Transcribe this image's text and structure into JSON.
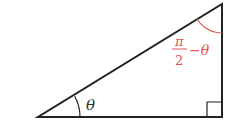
{
  "diagram": {
    "type": "right-triangle",
    "labels": {
      "angle_bottom_left": "θ",
      "angle_top_right_numerator": "π",
      "angle_top_right_denominator": "2",
      "angle_top_right_suffix": "−θ"
    },
    "colors": {
      "lines": "#222222",
      "accent": "#e05555"
    },
    "right_angle_marker": true
  }
}
